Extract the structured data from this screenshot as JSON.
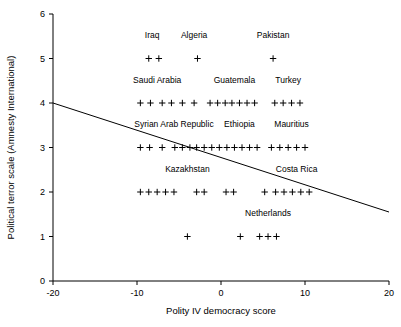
{
  "chart_data": {
    "type": "scatter",
    "title": "",
    "xlabel": "Polity IV democracy score",
    "ylabel": "Political terror scale (Amnesty International)",
    "xlim": [
      -20,
      20
    ],
    "ylim": [
      0,
      6
    ],
    "xticks": [
      -20,
      -10,
      0,
      10,
      20
    ],
    "xticklabels": [
      "-20",
      "-10",
      "0",
      "10",
      "20"
    ],
    "yticks": [
      0,
      1,
      2,
      3,
      4,
      5,
      6
    ],
    "yticklabels": [
      "0",
      "1",
      "2",
      "3",
      "4",
      "5",
      "6"
    ],
    "grid": false,
    "legend": false,
    "marker": "plus",
    "points": [
      {
        "x": -8.6,
        "y": 5
      },
      {
        "x": -7.4,
        "y": 5
      },
      {
        "x": -2.8,
        "y": 5
      },
      {
        "x": 6.2,
        "y": 5
      },
      {
        "x": -9.6,
        "y": 4
      },
      {
        "x": -8.4,
        "y": 4
      },
      {
        "x": -7.0,
        "y": 4
      },
      {
        "x": -5.9,
        "y": 4
      },
      {
        "x": -4.6,
        "y": 4
      },
      {
        "x": -3.2,
        "y": 4
      },
      {
        "x": -1.3,
        "y": 4
      },
      {
        "x": -0.4,
        "y": 4
      },
      {
        "x": 0.5,
        "y": 4
      },
      {
        "x": 1.3,
        "y": 4
      },
      {
        "x": 2.2,
        "y": 4
      },
      {
        "x": 3.1,
        "y": 4
      },
      {
        "x": 4.0,
        "y": 4
      },
      {
        "x": 6.4,
        "y": 4
      },
      {
        "x": 7.4,
        "y": 4
      },
      {
        "x": 8.4,
        "y": 4
      },
      {
        "x": 9.4,
        "y": 4
      },
      {
        "x": -9.6,
        "y": 3
      },
      {
        "x": -8.5,
        "y": 3
      },
      {
        "x": -7.0,
        "y": 3
      },
      {
        "x": -5.5,
        "y": 3
      },
      {
        "x": -4.6,
        "y": 3
      },
      {
        "x": -3.7,
        "y": 3
      },
      {
        "x": -2.9,
        "y": 3
      },
      {
        "x": -2.0,
        "y": 3
      },
      {
        "x": -1.1,
        "y": 3
      },
      {
        "x": -0.2,
        "y": 3
      },
      {
        "x": 0.7,
        "y": 3
      },
      {
        "x": 1.6,
        "y": 3
      },
      {
        "x": 2.5,
        "y": 3
      },
      {
        "x": 3.4,
        "y": 3
      },
      {
        "x": 4.3,
        "y": 3
      },
      {
        "x": 6.0,
        "y": 3
      },
      {
        "x": 7.0,
        "y": 3
      },
      {
        "x": 8.0,
        "y": 3
      },
      {
        "x": 9.0,
        "y": 3
      },
      {
        "x": 10.0,
        "y": 3
      },
      {
        "x": -9.6,
        "y": 2
      },
      {
        "x": -8.6,
        "y": 2
      },
      {
        "x": -7.6,
        "y": 2
      },
      {
        "x": -6.6,
        "y": 2
      },
      {
        "x": -5.6,
        "y": 2
      },
      {
        "x": -2.9,
        "y": 2
      },
      {
        "x": -2.0,
        "y": 2
      },
      {
        "x": 0.6,
        "y": 2
      },
      {
        "x": 1.5,
        "y": 2
      },
      {
        "x": 5.2,
        "y": 2
      },
      {
        "x": 6.5,
        "y": 2
      },
      {
        "x": 7.5,
        "y": 2
      },
      {
        "x": 8.5,
        "y": 2
      },
      {
        "x": 9.5,
        "y": 2
      },
      {
        "x": 10.5,
        "y": 2
      },
      {
        "x": -4.0,
        "y": 1
      },
      {
        "x": 2.3,
        "y": 1
      },
      {
        "x": 4.6,
        "y": 1
      },
      {
        "x": 5.6,
        "y": 1
      },
      {
        "x": 6.6,
        "y": 1
      }
    ],
    "annotations": [
      {
        "text": "Iraq",
        "x": -8.2,
        "y": 5.45
      },
      {
        "text": "Algeria",
        "x": -3.2,
        "y": 5.45
      },
      {
        "text": "Pakistan",
        "x": 6.2,
        "y": 5.45
      },
      {
        "text": "Saudi Arabia",
        "x": -7.6,
        "y": 4.45
      },
      {
        "text": "Guatemala",
        "x": 1.6,
        "y": 4.45
      },
      {
        "text": "Turkey",
        "x": 8.0,
        "y": 4.45
      },
      {
        "text": "Syrian Arab Republic",
        "x": -5.6,
        "y": 3.45
      },
      {
        "text": "Ethiopia",
        "x": 2.2,
        "y": 3.45
      },
      {
        "text": "Mauritius",
        "x": 8.4,
        "y": 3.45
      },
      {
        "text": "Kazakhstan",
        "x": -4.0,
        "y": 2.45
      },
      {
        "text": "Costa Rica",
        "x": 9.0,
        "y": 2.45
      },
      {
        "text": "Netherlands",
        "x": 5.6,
        "y": 1.45
      }
    ],
    "trend_line": {
      "type": "linear",
      "x_start": -20,
      "y_start": 4.0,
      "x_end": 20,
      "y_end": 1.55
    },
    "colors": {
      "axis": "#000000",
      "marker": "#000000",
      "trend_line": "#000000",
      "background": "#ffffff"
    }
  }
}
